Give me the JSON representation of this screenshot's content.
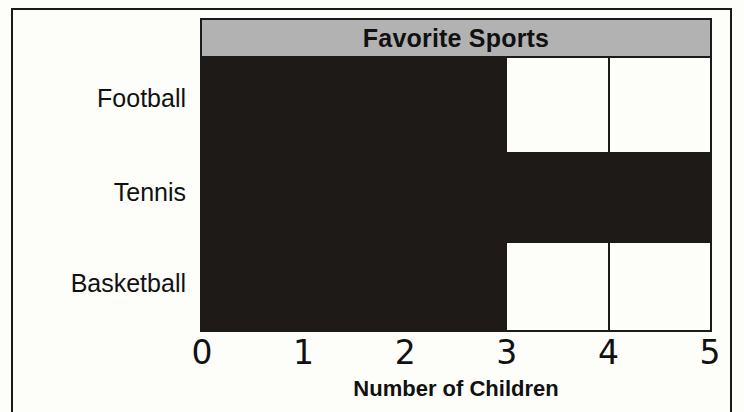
{
  "chart_data": {
    "type": "bar",
    "orientation": "horizontal",
    "title": "Favorite Sports",
    "xlabel": "Number of Children",
    "ylabel": "",
    "categories": [
      "Football",
      "Tennis",
      "Basketball"
    ],
    "values": [
      3,
      5,
      3
    ],
    "xticks": [
      "0",
      "1",
      "2",
      "3",
      "4",
      "5"
    ],
    "xtick_values": [
      0,
      1,
      2,
      3,
      4,
      5
    ],
    "xlim": [
      0,
      5
    ],
    "grid": true,
    "gridlines_x": [
      4
    ],
    "legend": null,
    "colors": {
      "bar": "#1d1a18",
      "title_bar": "#b2b2b2",
      "plot_background": "#fdfdfa",
      "axis": "#1b1b1b",
      "text": "#111111",
      "page_background": "#fdfdfa"
    }
  }
}
